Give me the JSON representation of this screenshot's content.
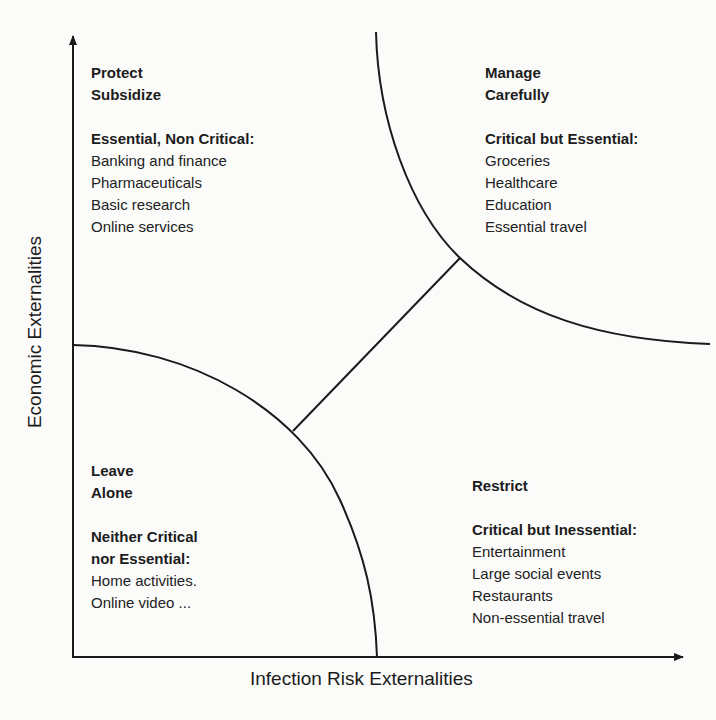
{
  "axes": {
    "x_label": "Infection Risk Externalities",
    "y_label": "Economic Externalities"
  },
  "quadrants": {
    "top_left": {
      "title_line1": "Protect",
      "title_line2": "Subsidize",
      "heading": "Essential, Non Critical:",
      "items": [
        "Banking and finance",
        "Pharmaceuticals",
        "Basic research",
        "Online services"
      ]
    },
    "top_right": {
      "title_line1": "Manage",
      "title_line2": "Carefully",
      "heading": "Critical but Essential:",
      "items": [
        "Groceries",
        "Healthcare",
        "Education",
        "Essential travel"
      ]
    },
    "bottom_left": {
      "title_line1": "Leave",
      "title_line2": "Alone",
      "heading_line1": "Neither Critical",
      "heading_line2": "nor Essential:",
      "items": [
        "Home activities.",
        "Online video ..."
      ]
    },
    "bottom_right": {
      "title_line1": "Restrict",
      "heading": "Critical but Inessential:",
      "items": [
        "Entertainment",
        "Large social events",
        "Restaurants",
        "Non-essential travel"
      ]
    }
  },
  "colors": {
    "line": "#1a1a1a",
    "background": "#fbfbfa"
  }
}
